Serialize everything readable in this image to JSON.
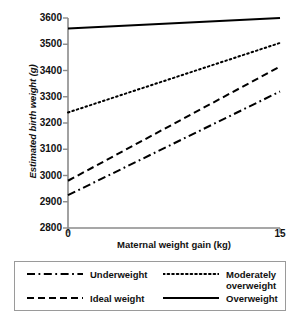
{
  "chart_data": {
    "type": "line",
    "title": "",
    "xlabel": "Maternal weight gain (kg)",
    "ylabel": "Estimated birth weight (g)",
    "xlim": [
      0,
      15
    ],
    "ylim": [
      2800,
      3600
    ],
    "grid": false,
    "legend_position": "below",
    "x_ticks": [
      {
        "value": 0,
        "label": "0"
      },
      {
        "value": 15,
        "label": "15"
      }
    ],
    "y_ticks": [
      {
        "value": 2800,
        "label": "2800"
      },
      {
        "value": 2900,
        "label": "2900"
      },
      {
        "value": 3000,
        "label": "3000"
      },
      {
        "value": 3100,
        "label": "3100"
      },
      {
        "value": 3200,
        "label": "3200"
      },
      {
        "value": 3300,
        "label": "3300"
      },
      {
        "value": 3400,
        "label": "3400"
      },
      {
        "value": 3500,
        "label": "3500"
      },
      {
        "value": 3600,
        "label": "3600"
      }
    ],
    "x": [
      0,
      15
    ],
    "series": [
      {
        "name": "Underweight",
        "style": "dash-dot",
        "color": "#000000",
        "values": [
          2925,
          3320
        ]
      },
      {
        "name": "Ideal weight",
        "style": "dashed",
        "color": "#000000",
        "values": [
          2980,
          3415
        ]
      },
      {
        "name": "Moderately overweight",
        "style": "dotted",
        "color": "#000000",
        "values": [
          3240,
          3505
        ]
      },
      {
        "name": "Overweight",
        "style": "solid",
        "color": "#000000",
        "values": [
          3560,
          3600
        ]
      }
    ]
  },
  "legend": {
    "entries": [
      {
        "label": "Underweight",
        "style": "dash-dot"
      },
      {
        "label": "Moderately\noverweight",
        "style": "dotted"
      },
      {
        "label": "Ideal weight",
        "style": "dashed"
      },
      {
        "label": "Overweight",
        "style": "solid"
      }
    ]
  },
  "y_tick_labels": [
    "3600",
    "3500",
    "3400",
    "3300",
    "3200",
    "3100",
    "3000",
    "2900",
    "2800"
  ],
  "x_tick_labels": [
    "0",
    "15"
  ]
}
